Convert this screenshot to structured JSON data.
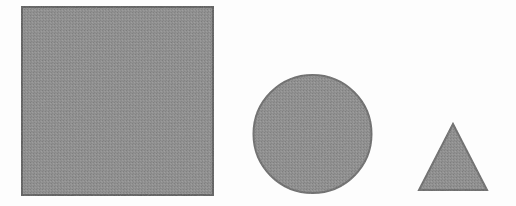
{
  "figure": {
    "title": "",
    "background_color": "#fdfdfd",
    "width": 516,
    "height": 206,
    "shape_fill_color": "#8a8a8a",
    "shape_outline_color": "#5f5f5f",
    "texture": "halftone-screen",
    "shapes": [
      {
        "name": "square",
        "label": "",
        "type": "rect",
        "x": 22,
        "y": 7,
        "width": 191,
        "height": 188,
        "fill": "#8a8a8a",
        "stroke": "#5c5c5c",
        "stroke_width": 2
      },
      {
        "name": "circle",
        "label": "",
        "type": "circle",
        "cx": 312.5,
        "cy": 134,
        "r": 59,
        "fill": "#8a8a8a",
        "stroke": "#6a6a6a",
        "stroke_width": 2
      },
      {
        "name": "triangle",
        "label": "",
        "type": "polygon",
        "points": "453,124 487,190 419,190",
        "apex_x": 453,
        "apex_y": 124,
        "base_left_x": 419,
        "base_right_x": 487,
        "base_y": 190,
        "fill": "#8a8a8a",
        "stroke": "#6a6a6a",
        "stroke_width": 2
      }
    ]
  }
}
